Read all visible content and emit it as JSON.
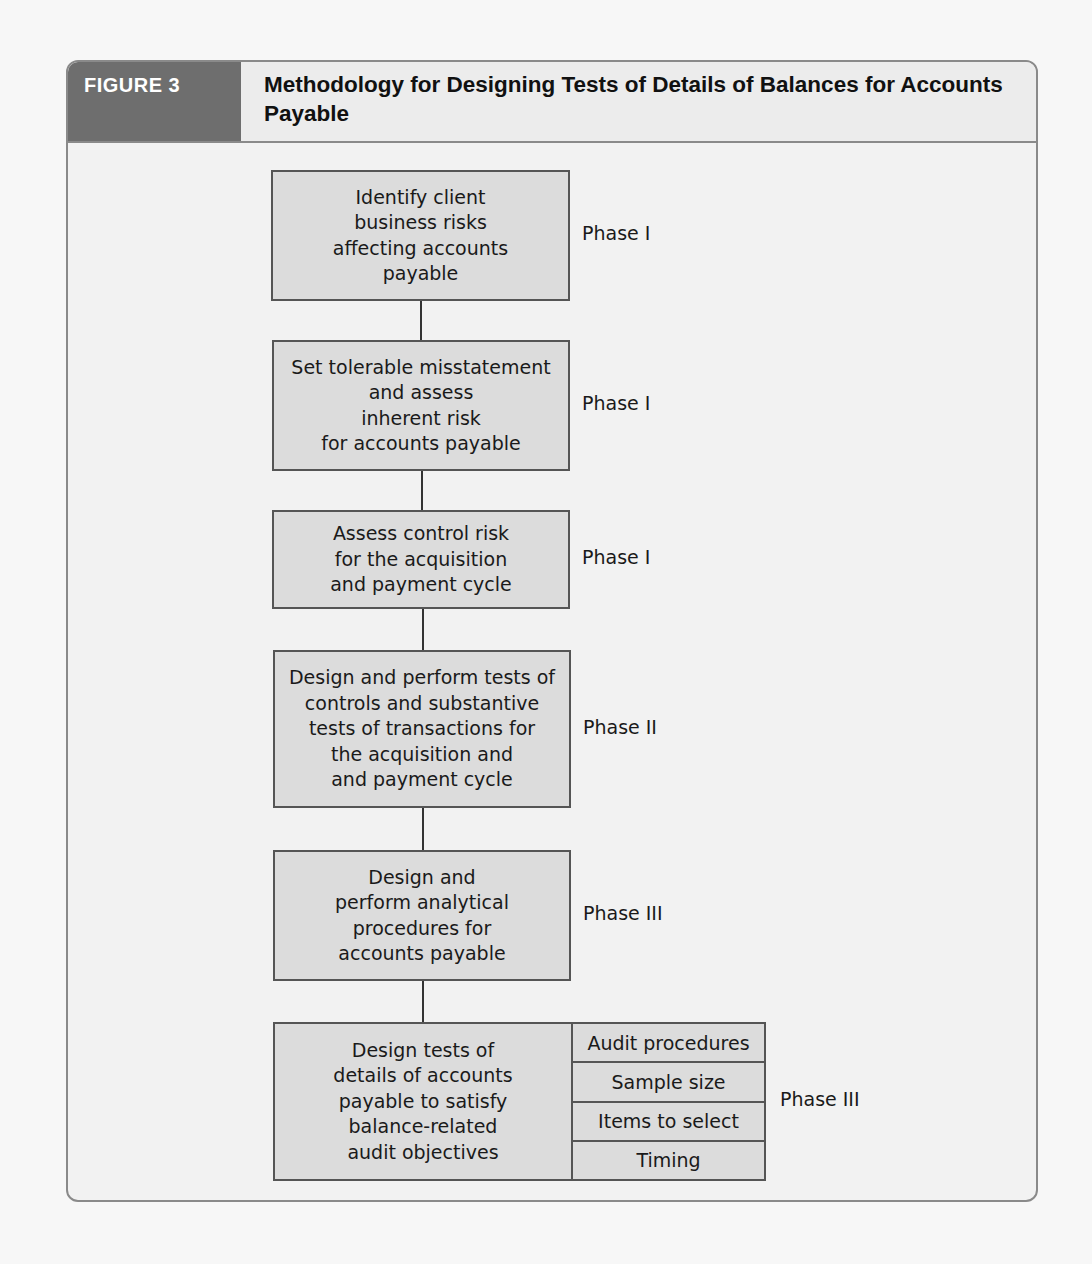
{
  "figure": {
    "label": "FIGURE 3",
    "title": "Methodology for Designing Tests of Details of Balances for Accounts Payable"
  },
  "steps": [
    {
      "text": "Identify client\nbusiness risks\naffecting accounts\npayable",
      "phase": "Phase I"
    },
    {
      "text": "Set tolerable misstatement\nand assess\ninherent risk\nfor accounts payable",
      "phase": "Phase I"
    },
    {
      "text": "Assess control risk\nfor the acquisition\nand payment cycle",
      "phase": "Phase I"
    },
    {
      "text": "Design and perform tests of\ncontrols and substantive\ntests of transactions for\nthe acquisition and\nand payment cycle",
      "phase": "Phase II"
    },
    {
      "text": "Design and\nperform analytical\nprocedures for\naccounts payable",
      "phase": "Phase III"
    },
    {
      "text": "Design tests of\ndetails of accounts\npayable to satisfy\nbalance-related\naudit objectives",
      "phase": "Phase III",
      "sub_items": [
        "Audit procedures",
        "Sample size",
        "Items to select",
        "Timing"
      ]
    }
  ],
  "colors": {
    "tab_bg": "#6e6e6e",
    "box_fill": "#dcdcdc",
    "box_border": "#555555",
    "frame_border": "#8a8a8a"
  }
}
